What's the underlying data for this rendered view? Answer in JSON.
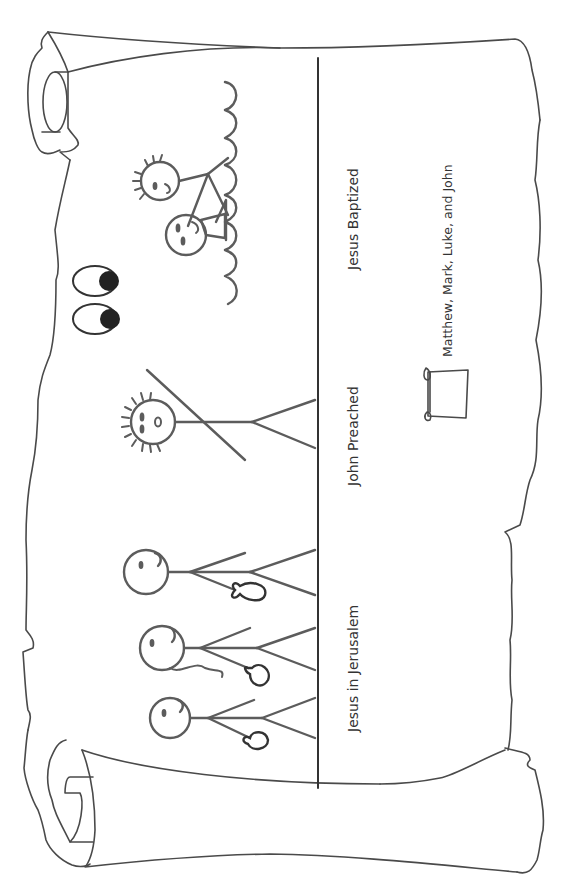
{
  "scroll": {
    "orientation": "rotated-90-ccw",
    "line_color": "#4a4a4a",
    "figure_color": "#5c5c5c"
  },
  "labels": {
    "scene_1": "Jesus in Jerusalem",
    "scene_2": "John Preached",
    "scene_3": "Jesus Baptized"
  },
  "legend": {
    "icon": "scroll-icon",
    "text": "Matthew, Mark, Luke, and John"
  }
}
